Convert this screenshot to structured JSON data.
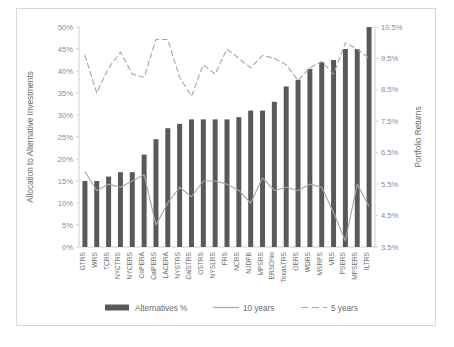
{
  "chart_data": {
    "type": "bar",
    "title": "",
    "xlabel": "",
    "ylabel": "Allocation to Alternative Investments",
    "y2label": "Portfolio Returns",
    "ylim": [
      0,
      50
    ],
    "y2lim": [
      3.5,
      10.5
    ],
    "grid": false,
    "legend_position": "bottom",
    "y_ticks": [
      "0%",
      "5%",
      "10%",
      "15%",
      "20%",
      "25%",
      "30%",
      "35%",
      "40%",
      "45%",
      "50%"
    ],
    "y2_ticks": [
      "3.5%",
      "4.5%",
      "5.5%",
      "6.5%",
      "7.5%",
      "8.5%",
      "9.5%",
      "10.5%"
    ],
    "categories": [
      "GTRS",
      "WRS",
      "TCRS",
      "NYCTRS",
      "NYCERS",
      "CoPERA",
      "CalPERS",
      "LACERA",
      "NYSTRS",
      "CalSTRS",
      "OSTRS",
      "NYSLRS",
      "FRS",
      "NCRS",
      "NJDPB",
      "MPSRS",
      "ERSOhio",
      "TexasTRS",
      "OERS",
      "WDRS",
      "MSRPS",
      "VRS",
      "PSERS",
      "MPSERS",
      "ILTRS"
    ],
    "series": [
      {
        "name": "Alternatives %",
        "type": "bar",
        "axis": "left",
        "color": "#595959",
        "unit": "%",
        "values": [
          15.0,
          15.0,
          16.0,
          17.0,
          17.0,
          21.0,
          24.5,
          27.0,
          28.0,
          29.0,
          29.0,
          29.0,
          29.0,
          29.5,
          31.0,
          31.0,
          33.0,
          36.5,
          38.0,
          40.5,
          42.0,
          42.5,
          45.0,
          45.0,
          50.0
        ]
      },
      {
        "name": "10 years",
        "type": "line",
        "axis": "right",
        "color": "#a6a6a6",
        "dash": "solid",
        "unit": "%",
        "values": [
          5.9,
          5.3,
          5.5,
          5.4,
          5.6,
          5.8,
          4.2,
          4.9,
          5.4,
          5.1,
          5.6,
          5.6,
          5.5,
          5.3,
          4.9,
          5.7,
          5.3,
          5.4,
          5.3,
          5.5,
          5.4,
          4.6,
          3.7,
          5.5,
          4.8
        ]
      },
      {
        "name": "5 years",
        "type": "line",
        "axis": "right",
        "color": "#a6a6a6",
        "dash": "dashed",
        "unit": "%",
        "values": [
          9.6,
          8.4,
          9.2,
          9.7,
          9.0,
          8.9,
          10.1,
          10.1,
          8.9,
          8.3,
          9.3,
          9.0,
          9.8,
          9.5,
          9.2,
          9.6,
          9.5,
          9.3,
          8.8,
          9.2,
          9.4,
          9.0,
          10.0,
          9.8,
          9.5
        ]
      }
    ],
    "legend": [
      {
        "label": "Alternatives %",
        "marker": "bar",
        "color": "#595959"
      },
      {
        "label": "10 years",
        "marker": "line-solid",
        "color": "#a6a6a6"
      },
      {
        "label": "5 years",
        "marker": "line-dashed",
        "color": "#a6a6a6"
      }
    ]
  },
  "caption": {
    "text": ""
  }
}
